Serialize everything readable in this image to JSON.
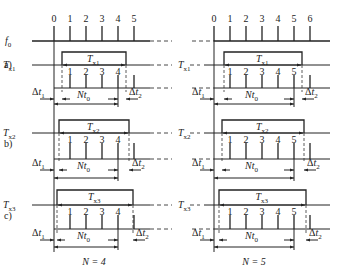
{
  "signal_label": "f",
  "signal_sub": "0",
  "left_panel": {
    "ticks": [
      "0",
      "1",
      "2",
      "3",
      "4",
      "5"
    ],
    "caption": "N = 4",
    "rows": [
      {
        "tag": "a)",
        "gate_label": "T",
        "gate_sub": "x1",
        "counts": [
          "1",
          "2",
          "3",
          "4"
        ],
        "dt1": "Δt",
        "dt1_sub": "1",
        "dt2": "Δt",
        "dt2_sub": "2",
        "nt": "Nt",
        "nt_sub": "0"
      },
      {
        "tag": "b)",
        "gate_label": "T",
        "gate_sub": "x2",
        "counts": [
          "1",
          "2",
          "3",
          "4"
        ],
        "dt1": "Δt",
        "dt1_sub": "1",
        "dt2": "Δt",
        "dt2_sub": "2",
        "nt": "Nt",
        "nt_sub": "0"
      },
      {
        "tag": "c)",
        "gate_label": "T",
        "gate_sub": "x3",
        "counts": [
          "1",
          "2",
          "3",
          "4"
        ],
        "dt1": "Δt",
        "dt1_sub": "1",
        "dt2": "Δt",
        "dt2_sub": "2",
        "nt": "Nt",
        "nt_sub": "0"
      }
    ]
  },
  "right_panel": {
    "ticks": [
      "0",
      "1",
      "2",
      "3",
      "4",
      "5",
      "6"
    ],
    "caption": "N = 5",
    "rows": [
      {
        "gate_label": "T",
        "gate_sub": "x1",
        "counts": [
          "1",
          "2",
          "3",
          "4",
          "5"
        ],
        "dt1": "Δt",
        "dt1_sub": "1",
        "dt2": "Δt",
        "dt2_sub": "2",
        "nt": "Nt",
        "nt_sub": "0"
      },
      {
        "gate_label": "T",
        "gate_sub": "x2",
        "counts": [
          "1",
          "2",
          "3",
          "4",
          "5"
        ],
        "dt1": "Δt",
        "dt1_sub": "1",
        "dt2": "Δt",
        "dt2_sub": "2",
        "nt": "Nt",
        "nt_sub": "0"
      },
      {
        "gate_label": "T",
        "gate_sub": "x3",
        "counts": [
          "1",
          "2",
          "3",
          "4",
          "5"
        ],
        "dt1": "Δt",
        "dt1_sub": "1",
        "dt2": "Δt",
        "dt2_sub": "2",
        "nt": "Nt",
        "nt_sub": "0"
      }
    ]
  }
}
